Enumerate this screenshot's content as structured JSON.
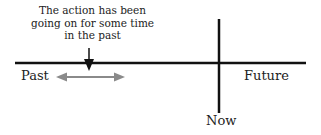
{
  "diagram": {
    "caption_lines": [
      "The action has been",
      "going on for some time",
      "in the past"
    ],
    "labels": {
      "past": "Past",
      "future": "Future",
      "now": "Now"
    },
    "colors": {
      "timeline": "#111111",
      "range_arrow": "#8a8a8a",
      "pointer_arrow": "#111111",
      "text": "#222222"
    },
    "elements": {
      "timeline": "horizontal line (past to future)",
      "now_marker": "vertical line marking the present",
      "pointer_arrow": "down arrow pointing to a moment in the past",
      "duration_arrow": "gray double-headed arrow indicating continuous duration in the past"
    }
  }
}
